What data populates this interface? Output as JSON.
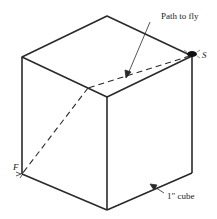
{
  "diagram": {
    "labels": {
      "path": "Path to fly",
      "start": "S",
      "finish": "F",
      "cube": "1\" cube"
    },
    "colors": {
      "stroke": "#2a2a2a",
      "background": "#ffffff"
    }
  }
}
